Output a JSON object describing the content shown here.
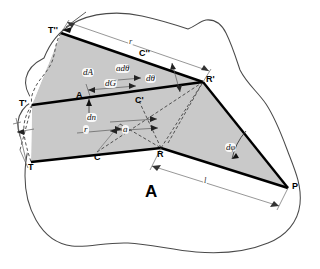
{
  "figure": {
    "caption_letter": "A",
    "colors": {
      "shade_fill": "#c9c9c9",
      "outline": "#3a3a3a",
      "bold_line": "#000000",
      "thin_line": "#5a5a5a",
      "dashed_line": "#4a4a4a",
      "background": "#ffffff"
    },
    "points": [
      {
        "id": "T2",
        "label": "T''",
        "x": 61,
        "y": 31
      },
      {
        "id": "R2",
        "label": "R'",
        "x": 203,
        "y": 81
      },
      {
        "id": "T1",
        "label": "T'",
        "x": 32,
        "y": 104
      },
      {
        "id": "C2",
        "label": "C''",
        "x": 142,
        "y": 56
      },
      {
        "id": "C1",
        "label": "C'",
        "x": 139,
        "y": 101
      },
      {
        "id": "C0",
        "label": "C",
        "x": 97,
        "y": 152
      },
      {
        "id": "R0",
        "label": "R",
        "x": 161,
        "y": 148
      },
      {
        "id": "T0",
        "label": "T",
        "x": 31,
        "y": 162
      },
      {
        "id": "P",
        "label": "P",
        "x": 288,
        "y": 188
      },
      {
        "id": "A0",
        "label": "A",
        "x": 80,
        "y": 96
      }
    ],
    "measures": [
      {
        "id": "dA",
        "label": "dA",
        "x": 88,
        "y": 73
      },
      {
        "id": "adth",
        "label": "adθ",
        "x": 125,
        "y": 70
      },
      {
        "id": "dG",
        "label": "dG",
        "x": 112,
        "y": 84
      },
      {
        "id": "dth",
        "label": "dθ",
        "x": 152,
        "y": 80
      },
      {
        "id": "dn",
        "label": "dn",
        "x": 92,
        "y": 118
      },
      {
        "id": "r_lo",
        "label": "r",
        "x": 87,
        "y": 130
      },
      {
        "id": "a",
        "label": "a",
        "x": 125,
        "y": 131
      },
      {
        "id": "r_hi",
        "label": "r",
        "x": 131,
        "y": 41
      },
      {
        "id": "dphi",
        "label": "dφ",
        "x": 231,
        "y": 149
      },
      {
        "id": "l",
        "label": "l",
        "x": 205,
        "y": 180
      }
    ]
  }
}
